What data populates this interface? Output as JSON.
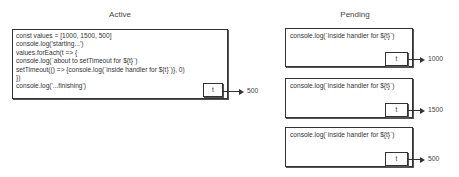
{
  "active": {
    "title": "Active",
    "code_lines": [
      "const values = [1000, 1500, 500]",
      " console.log('starting...')",
      " values.forEach(t => {",
      " console.log(`about to setTimeout for ${t}`)",
      " setTimeout(() => {console.log(`inside handler for ${t}`)}, 0)",
      " })",
      " console.log('...finishing')"
    ],
    "param_label": "t",
    "arrow_value": "500"
  },
  "pending": {
    "title": "Pending",
    "items": [
      {
        "code": "console.log(`inside handler for ${t}`)",
        "param_label": "t",
        "arrow_value": "1000"
      },
      {
        "code": "console.log(`inside handler for ${t}`)",
        "param_label": "t",
        "arrow_value": "1500"
      },
      {
        "code": "console.log(`inside handler for ${t}`)",
        "param_label": "t",
        "arrow_value": "500"
      }
    ]
  }
}
